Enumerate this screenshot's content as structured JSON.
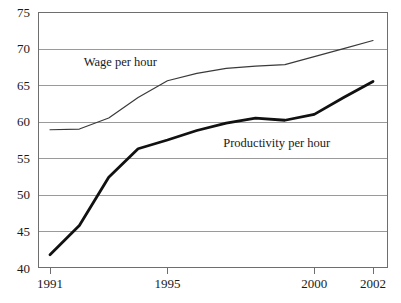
{
  "chart_data": {
    "type": "line",
    "title": "",
    "xlabel": "",
    "ylabel": "",
    "x": [
      1991,
      1992,
      1993,
      1994,
      1995,
      1996,
      1997,
      1998,
      1999,
      2000,
      2001,
      2002
    ],
    "xlim": [
      1991,
      2002
    ],
    "ylim": [
      40,
      75
    ],
    "grid": true,
    "legend_position": "inline-annotation",
    "x_tick_labels": [
      "1991",
      "1995",
      "2000",
      "2002"
    ],
    "x_tick_values": [
      1991,
      1995,
      2000,
      2002
    ],
    "y_tick_labels": [
      "40",
      "45",
      "50",
      "55",
      "60",
      "65",
      "70",
      "75"
    ],
    "y_tick_values": [
      40,
      45,
      50,
      55,
      60,
      65,
      70,
      75
    ],
    "series": [
      {
        "name": "Wage per hour",
        "label": "Wage per hour",
        "color": "#3a3a3a",
        "stroke_width": 1.2,
        "label_x": 1992.15,
        "label_y": 67.6,
        "values": [
          58.9,
          59.0,
          60.5,
          63.3,
          65.6,
          66.6,
          67.3,
          67.6,
          67.8,
          68.9,
          70.0,
          71.1
        ]
      },
      {
        "name": "Productivity per hour",
        "label": "Productivity per hour",
        "color": "#111111",
        "stroke_width": 2.8,
        "label_x": 1996.9,
        "label_y": 56.6,
        "values": [
          41.8,
          45.8,
          52.4,
          56.3,
          57.5,
          58.8,
          59.8,
          60.5,
          60.2,
          61.0,
          63.3,
          65.5
        ]
      }
    ]
  },
  "plot_geometry": {
    "left": 38,
    "right": 388,
    "top": 12,
    "bottom": 268,
    "x_data_left": 50,
    "x_data_right": 373
  },
  "colors": {
    "background": "#ffffff",
    "gridline": "#9a9a9a",
    "frame": "#6e6e6e",
    "text": "#1a1a1a",
    "wage_line": "#3a3a3a",
    "productivity_line": "#111111"
  }
}
